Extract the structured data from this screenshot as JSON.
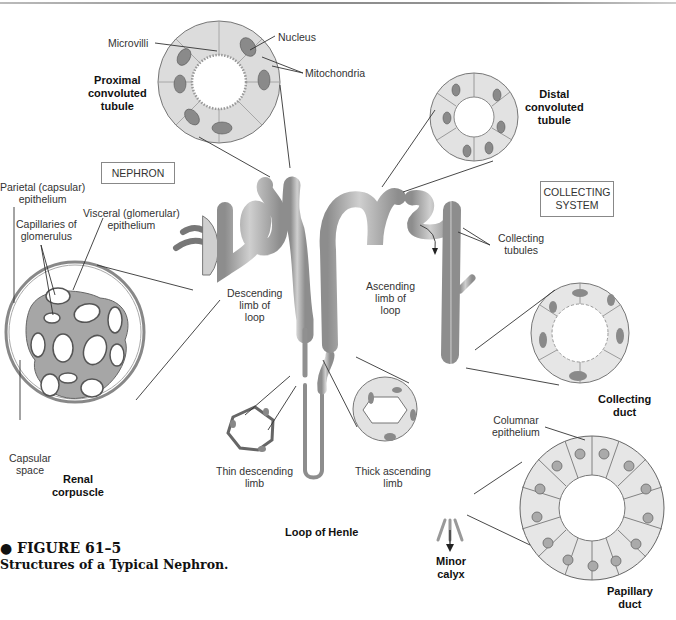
{
  "figure": {
    "bullet": "●",
    "number": "FIGURE 61–5",
    "title": "Structures of a Typical Nephron."
  },
  "boxes": {
    "nephron": "NEPHRON",
    "collecting_system": "COLLECTING\nSYSTEM"
  },
  "labels": {
    "microvilli": "Microvilli",
    "nucleus": "Nucleus",
    "mitochondria": "Mitochondria",
    "proximal_convoluted_tubule": "Proximal\nconvoluted\ntubule",
    "distal_convoluted_tubule": "Distal\nconvoluted\ntubule",
    "parietal_epithelium": "Parietal (capsular)\nepithelium",
    "capillaries_of_glomerulus": "Capillaries of\nglomerulus",
    "visceral_epithelium": "Visceral (glomerular)\nepithelium",
    "descending_limb_of_loop": "Descending\nlimb of\nloop",
    "ascending_limb_of_loop": "Ascending\nlimb of\nloop",
    "collecting_tubules": "Collecting\ntubules",
    "capsular_space": "Capsular\nspace",
    "renal_corpuscle": "Renal\ncorpuscle",
    "thin_descending_limb": "Thin descending\nlimb",
    "thick_ascending_limb": "Thick ascending\nlimb",
    "loop_of_henle": "Loop of Henle",
    "collecting_duct": "Collecting\nduct",
    "columnar_epithelium": "Columnar\nepithelium",
    "minor_calyx": "Minor\ncalyx",
    "papillary_duct": "Papillary\nduct"
  },
  "colors": {
    "tube": "#9a9a9a",
    "tube_light": "#c8c8c8",
    "cell_fill": "#e6e6e6",
    "nucleus": "#8a8a8a",
    "line": "#333333"
  }
}
